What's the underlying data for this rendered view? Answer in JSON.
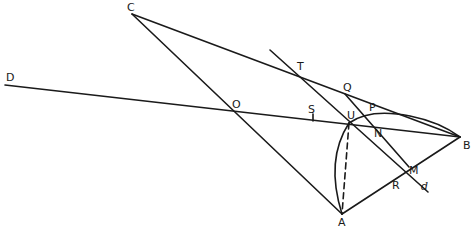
{
  "diagram": {
    "type": "geometric-construction",
    "points": {
      "A": {
        "label": "A",
        "x": 342,
        "y": 214
      },
      "B": {
        "label": "B",
        "x": 460,
        "y": 137
      },
      "C": {
        "label": "C",
        "x": 132,
        "y": 14
      },
      "D": {
        "label": "D",
        "x": 5,
        "y": 85
      },
      "O": {
        "label": "O",
        "x": 238,
        "y": 110
      },
      "T": {
        "label": "T",
        "x": 298,
        "y": 73
      },
      "Q": {
        "label": "Q",
        "x": 345,
        "y": 94
      },
      "U": {
        "label": "U",
        "x": 349,
        "y": 123
      },
      "P": {
        "label": "P",
        "x": 371,
        "y": 114
      },
      "N": {
        "label": "N",
        "x": 373,
        "y": 131
      },
      "S": {
        "label": "S",
        "x": 313,
        "y": 118
      },
      "M": {
        "label": "M",
        "x": 409,
        "y": 167
      },
      "R": {
        "label": "R",
        "x": 395,
        "y": 176
      },
      "d": {
        "label": "d"
      }
    },
    "stroke_color": "#1a1a1a",
    "background": "#ffffff"
  }
}
